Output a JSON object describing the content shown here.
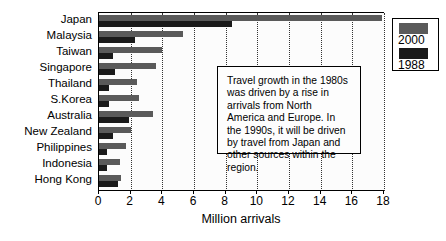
{
  "chart_data": {
    "type": "bar",
    "orientation": "horizontal",
    "title": "",
    "xlabel": "Million arrivals",
    "ylabel": "",
    "xlim": [
      0,
      18
    ],
    "xticks": [
      0,
      2,
      4,
      6,
      8,
      10,
      12,
      14,
      16,
      18
    ],
    "grid": true,
    "legend_position": "top-right",
    "categories": [
      "Japan",
      "Malaysia",
      "Taiwan",
      "Singapore",
      "Thailand",
      "S.Korea",
      "Australia",
      "New Zealand",
      "Philippines",
      "Indonesia",
      "Hong Kong"
    ],
    "series": [
      {
        "name": "2000",
        "color": "#5a5a5a",
        "values": [
          17.9,
          5.3,
          4.0,
          3.6,
          2.4,
          2.5,
          3.4,
          2.0,
          1.7,
          1.3,
          1.4
        ]
      },
      {
        "name": "1988",
        "color": "#1a1a1a",
        "values": [
          8.4,
          2.3,
          0.9,
          1.0,
          0.6,
          0.6,
          1.9,
          0.9,
          0.5,
          0.5,
          1.2
        ]
      }
    ],
    "annotations": [
      {
        "text": "Travel growth in the 1980s was driven by a rise in arrivals from North America and Europe.  In the 1990s, it will be driven by travel from Japan and other sources within the region."
      }
    ]
  },
  "legend": {
    "items": [
      {
        "label": "2000",
        "color": "#5a5a5a"
      },
      {
        "label": "1988",
        "color": "#1a1a1a"
      }
    ]
  },
  "axis": {
    "x_title": "Million arrivals",
    "tick_labels": [
      "0",
      "2",
      "4",
      "6",
      "8",
      "10",
      "12",
      "14",
      "16",
      "18"
    ]
  },
  "annotation": {
    "text": "Travel growth in the 1980s was driven by a rise in arrivals from North America and Europe.  In the 1990s, it will be driven by travel from Japan and other sources within the region."
  }
}
